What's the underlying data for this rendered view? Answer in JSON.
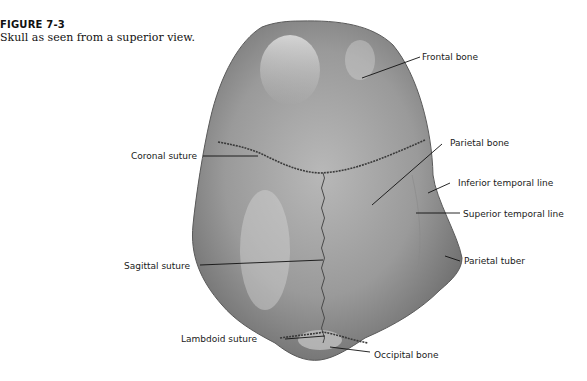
{
  "figure": {
    "number": "FIGURE 7-3",
    "caption": "Skull as seen from a superior view."
  },
  "labels": {
    "frontal_bone": "Frontal bone",
    "coronal_suture": "Coronal suture",
    "parietal_bone": "Parietal bone",
    "inferior_temporal_line": "Inferior temporal line",
    "superior_temporal_line": "Superior temporal line",
    "sagittal_suture": "Sagittal suture",
    "parietal_tuber": "Parietal tuber",
    "lambdoid_suture": "Lambdoid suture",
    "occipital_bone": "Occipital bone"
  }
}
